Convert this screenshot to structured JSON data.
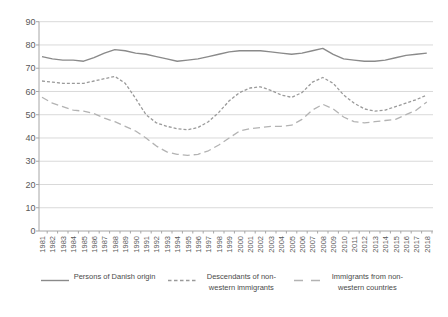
{
  "chart": {
    "background": "#ffffff",
    "gridline_color": "#d9d9d9",
    "axis_color": "#a6a6a6",
    "tick_label_color": "#595959",
    "plot": {
      "left_axis_x": 39,
      "right_x": 433,
      "y_zero": 231,
      "y_at_max": 21.7,
      "x_first": 42,
      "x_last": 426.8,
      "y_label_x": 35.5,
      "x_label_y": 236
    }
  },
  "chart_data": {
    "type": "line",
    "title": "",
    "xlabel": "",
    "ylabel": "",
    "ylim": [
      0,
      90
    ],
    "yticks": [
      0,
      10,
      20,
      30,
      40,
      50,
      60,
      70,
      80,
      90
    ],
    "grid": true,
    "legend_position": "bottom",
    "categories": [
      "1981",
      "1982",
      "1983",
      "1984",
      "1985",
      "1986",
      "1987",
      "1988",
      "1989",
      "1990",
      "1991",
      "1992",
      "1993",
      "1994",
      "1995",
      "1996",
      "1997",
      "1998",
      "1999",
      "2000",
      "2001",
      "2002",
      "2003",
      "2004",
      "2005",
      "2006",
      "2007",
      "2008",
      "2009",
      "2010",
      "2011",
      "2012",
      "2013",
      "2014",
      "2015",
      "2016",
      "2017",
      "2018"
    ],
    "series": [
      {
        "name": "Persons of Danish origin",
        "color": "#8a8a8a",
        "dash": "solid",
        "values": [
          75,
          74,
          73.5,
          73.5,
          73,
          74.5,
          76.5,
          78,
          77.5,
          76.5,
          76,
          75,
          74,
          73,
          73.5,
          74,
          75,
          76,
          77,
          77.5,
          77.5,
          77.5,
          77,
          76.5,
          76,
          76.5,
          77.5,
          78.5,
          76,
          74,
          73.5,
          73,
          73,
          73.5,
          74.5,
          75.5,
          76,
          76.5
        ]
      },
      {
        "name": "Descendants of non-western immigrants",
        "color": "#9a9a9a",
        "dash": "short",
        "values": [
          64.5,
          64,
          63.5,
          63.5,
          63.5,
          64.5,
          65.5,
          66.5,
          63.5,
          57,
          50,
          46.5,
          45,
          44,
          43.5,
          44.5,
          47,
          51,
          56,
          59.5,
          61.5,
          62,
          60.5,
          58.5,
          57.5,
          59.5,
          64,
          66,
          63.5,
          58.5,
          55,
          52.5,
          51.5,
          52,
          53.5,
          55,
          56.5,
          58.5
        ]
      },
      {
        "name": "Immigrants from non-western countries",
        "color": "#b3b3b3",
        "dash": "long",
        "values": [
          57.5,
          55,
          53.5,
          52,
          51.5,
          50.5,
          48.5,
          47,
          45,
          43,
          40,
          36.5,
          34,
          33,
          32.5,
          33,
          34.5,
          37,
          40,
          43,
          44,
          44.5,
          45,
          45,
          45.5,
          48,
          52,
          54.5,
          52.5,
          49,
          47,
          46.5,
          47,
          47.5,
          48,
          50,
          52,
          55.5
        ]
      }
    ]
  }
}
